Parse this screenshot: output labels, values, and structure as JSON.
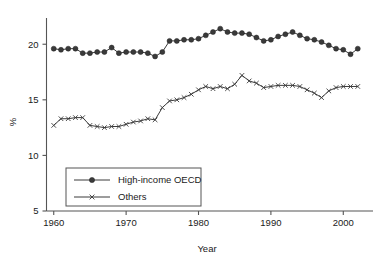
{
  "chart_data": {
    "type": "line",
    "title": "",
    "xlabel": "Year",
    "ylabel": "%",
    "xlim": [
      1959,
      2003
    ],
    "ylim": [
      5,
      22
    ],
    "grid": false,
    "legend_position": "lower-left-inside",
    "xticks": [
      1960,
      1970,
      1980,
      1990,
      2000
    ],
    "xtick_labels": [
      "1960",
      "1970",
      "1980",
      "1990",
      "2000"
    ],
    "yticks": [
      5,
      10,
      15,
      20
    ],
    "ytick_labels": [
      "5",
      "10",
      "15",
      "20"
    ],
    "x": [
      1960,
      1961,
      1962,
      1963,
      1964,
      1965,
      1966,
      1967,
      1968,
      1969,
      1970,
      1971,
      1972,
      1973,
      1974,
      1975,
      1976,
      1977,
      1978,
      1979,
      1980,
      1981,
      1982,
      1983,
      1984,
      1985,
      1986,
      1987,
      1988,
      1989,
      1990,
      1991,
      1992,
      1993,
      1994,
      1995,
      1996,
      1997,
      1998,
      1999,
      2000,
      2001,
      2002
    ],
    "series": [
      {
        "name": "High-income OECD",
        "marker": "circle",
        "values": [
          19.6,
          19.5,
          19.6,
          19.6,
          19.2,
          19.2,
          19.3,
          19.3,
          19.7,
          19.2,
          19.3,
          19.3,
          19.3,
          19.2,
          18.9,
          19.3,
          20.3,
          20.3,
          20.4,
          20.4,
          20.5,
          20.8,
          21.1,
          21.4,
          21.1,
          21.0,
          21.0,
          20.9,
          20.6,
          20.3,
          20.4,
          20.7,
          20.9,
          21.1,
          20.8,
          20.5,
          20.4,
          20.2,
          19.9,
          19.6,
          19.5,
          19.1,
          19.6
        ]
      },
      {
        "name": "Others",
        "marker": "x",
        "values": [
          12.7,
          13.3,
          13.3,
          13.4,
          13.4,
          12.7,
          12.6,
          12.5,
          12.6,
          12.6,
          12.8,
          13.0,
          13.1,
          13.3,
          13.2,
          14.3,
          14.9,
          15.0,
          15.2,
          15.5,
          15.9,
          16.2,
          16.0,
          16.2,
          16.0,
          16.4,
          17.2,
          16.7,
          16.5,
          16.1,
          16.2,
          16.3,
          16.3,
          16.3,
          16.2,
          15.9,
          15.6,
          15.2,
          15.8,
          16.1,
          16.2,
          16.2,
          16.2
        ]
      }
    ]
  },
  "legend": {
    "entries": [
      {
        "label": "High-income OECD",
        "marker": "circle"
      },
      {
        "label": "Others",
        "marker": "x"
      }
    ]
  },
  "axes": {
    "x_title": "Year",
    "y_title": "%"
  }
}
